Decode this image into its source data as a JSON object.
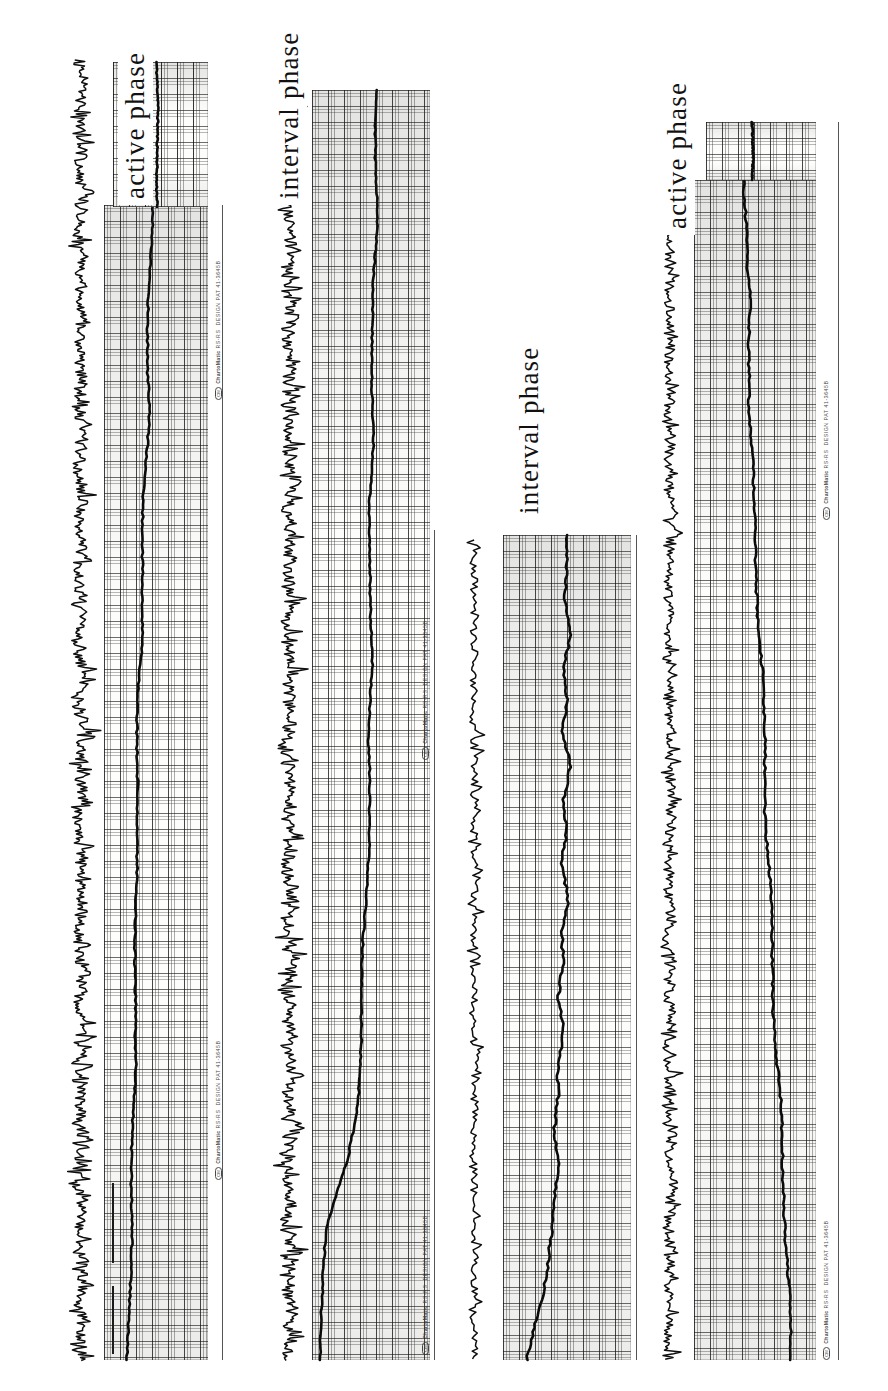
{
  "document": {
    "type": "scanned-chart-recorder-strips",
    "background_color": "#ffffff",
    "ink_color": "#111111",
    "orientation": "strips-rotated-90-ccw",
    "width": 888,
    "height": 1391
  },
  "strips": [
    {
      "id": "strip-1",
      "phase_label": "active phase",
      "brand": {
        "logo": "CM",
        "maker": "ChartoMatic",
        "model": "RS-RS",
        "design": "DESIGN PAT",
        "patent_no": "41-3645B"
      }
    },
    {
      "id": "strip-2",
      "phase_label": "interval phase",
      "brand": {
        "logo": "CM",
        "maker": "ChartoMatic",
        "model": "RS-RS",
        "design": "DESIGN PAT",
        "patent_no": "41-3645B"
      }
    },
    {
      "id": "strip-3",
      "phase_label": "interval phase",
      "brand": {
        "logo": "CM",
        "maker": "ChartoMatic",
        "model": "RS-RS",
        "design": "DESIGN PAT",
        "patent_no": "41-3645B"
      }
    },
    {
      "id": "strip-4",
      "phase_label": "active phase",
      "brand": {
        "logo": "CM",
        "maker": "ChartoMatic",
        "model": "RS-RS",
        "design": "DESIGN PAT",
        "patent_no": "41-3645B"
      }
    }
  ],
  "chart_data": {
    "type": "line",
    "title": "",
    "xlabel": "",
    "ylabel": "",
    "grid": true,
    "legend": "none",
    "note": "Four chart-recorder paper strips, each rotated 90 degrees counter-clockwise. Each strip carries a high-frequency noisy raw trace and a smooth slow trend line drawn on gridded recorder paper. Values below are normalised 0-1 along the strip length (x = time along the strip, y = pen deflection).",
    "charts": [
      {
        "id": "strip-1",
        "phase": "active phase",
        "series": [
          {
            "name": "trend",
            "x": [
              0.0,
              0.03,
              0.06,
              0.09,
              0.12,
              0.15,
              0.18,
              0.21,
              0.24,
              0.27,
              0.3,
              0.33,
              0.36,
              0.39,
              0.42,
              0.45,
              0.48,
              0.51,
              0.54,
              0.57,
              0.6,
              0.63,
              0.66,
              0.69,
              0.72,
              0.75,
              0.78,
              0.81,
              0.84,
              0.87,
              0.9,
              0.93,
              0.96,
              1.0
            ],
            "values": [
              0.46,
              0.47,
              0.45,
              0.44,
              0.46,
              0.45,
              0.43,
              0.41,
              0.4,
              0.42,
              0.41,
              0.39,
              0.38,
              0.37,
              0.36,
              0.37,
              0.35,
              0.34,
              0.33,
              0.32,
              0.31,
              0.32,
              0.31,
              0.3,
              0.29,
              0.28,
              0.29,
              0.28,
              0.27,
              0.26,
              0.26,
              0.25,
              0.25,
              0.24
            ]
          },
          {
            "name": "raw",
            "amplitude": 0.3,
            "noise": "high-frequency spiky EMG-like burst train"
          }
        ]
      },
      {
        "id": "strip-2",
        "phase": "interval phase",
        "series": [
          {
            "name": "trend",
            "x": [
              0.0,
              0.03,
              0.06,
              0.09,
              0.12,
              0.15,
              0.18,
              0.21,
              0.24,
              0.27,
              0.3,
              0.33,
              0.36,
              0.39,
              0.42,
              0.45,
              0.48,
              0.51,
              0.54,
              0.57,
              0.6,
              0.63,
              0.66,
              0.69,
              0.72,
              0.75,
              0.78,
              0.81,
              0.84,
              0.87,
              0.9,
              0.93,
              0.96,
              1.0
            ],
            "values": [
              0.55,
              0.54,
              0.53,
              0.54,
              0.53,
              0.52,
              0.53,
              0.52,
              0.51,
              0.52,
              0.51,
              0.5,
              0.51,
              0.5,
              0.49,
              0.5,
              0.49,
              0.48,
              0.49,
              0.47,
              0.46,
              0.45,
              0.44,
              0.43,
              0.42,
              0.41,
              0.4,
              0.38,
              0.33,
              0.22,
              0.12,
              0.09,
              0.08,
              0.08
            ]
          },
          {
            "name": "raw",
            "amplitude": 0.35,
            "noise": "high-frequency spiky burst train with large transient near mid-strip"
          }
        ]
      },
      {
        "id": "strip-3",
        "phase": "interval phase",
        "series": [
          {
            "name": "trend",
            "x": [
              0.0,
              0.04,
              0.08,
              0.12,
              0.16,
              0.2,
              0.24,
              0.28,
              0.32,
              0.36,
              0.4,
              0.44,
              0.48,
              0.52,
              0.56,
              0.6,
              0.64,
              0.68,
              0.72,
              0.76,
              0.8,
              0.84,
              0.88,
              0.92,
              0.96,
              1.0
            ],
            "values": [
              0.5,
              0.52,
              0.49,
              0.53,
              0.48,
              0.52,
              0.47,
              0.51,
              0.46,
              0.5,
              0.45,
              0.49,
              0.45,
              0.48,
              0.44,
              0.47,
              0.43,
              0.45,
              0.42,
              0.43,
              0.4,
              0.39,
              0.36,
              0.3,
              0.22,
              0.18
            ]
          },
          {
            "name": "raw",
            "amplitude": 0.22,
            "noise": "low-density spiky trace, sparse bursts"
          }
        ]
      },
      {
        "id": "strip-4",
        "phase": "active phase",
        "series": [
          {
            "name": "trend",
            "x": [
              0.0,
              0.03,
              0.06,
              0.09,
              0.12,
              0.15,
              0.18,
              0.21,
              0.24,
              0.27,
              0.3,
              0.33,
              0.36,
              0.39,
              0.42,
              0.45,
              0.48,
              0.51,
              0.54,
              0.57,
              0.6,
              0.63,
              0.66,
              0.69,
              0.72,
              0.75,
              0.78,
              0.81,
              0.84,
              0.87,
              0.9,
              0.93,
              0.96,
              1.0
            ],
            "values": [
              0.42,
              0.44,
              0.43,
              0.45,
              0.44,
              0.46,
              0.45,
              0.47,
              0.46,
              0.48,
              0.47,
              0.49,
              0.5,
              0.52,
              0.53,
              0.55,
              0.56,
              0.58,
              0.59,
              0.6,
              0.62,
              0.63,
              0.64,
              0.66,
              0.67,
              0.68,
              0.7,
              0.71,
              0.72,
              0.74,
              0.75,
              0.76,
              0.77,
              0.78
            ]
          },
          {
            "name": "raw",
            "amplitude": 0.26,
            "noise": "regular spiky burst train, moderate amplitude"
          }
        ]
      }
    ]
  }
}
